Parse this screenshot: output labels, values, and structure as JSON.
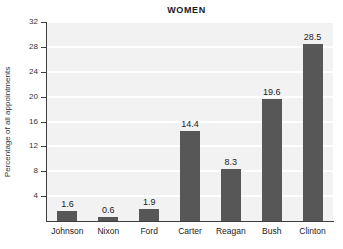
{
  "chart_data": {
    "type": "bar",
    "title": "WOMEN",
    "xlabel": "",
    "ylabel": "Percentage of all appointments",
    "categories": [
      "Johnson",
      "Nixon",
      "Ford",
      "Carter",
      "Reagan",
      "Bush",
      "Clinton"
    ],
    "values": [
      1.6,
      0.6,
      1.9,
      14.4,
      8.3,
      19.6,
      28.5
    ],
    "value_labels": [
      "1.6",
      "0.6",
      "1.9",
      "14.4",
      "8.3",
      "19.6",
      "28.5"
    ],
    "ylim": [
      0,
      32
    ],
    "yticks": [
      4,
      8,
      12,
      16,
      20,
      24,
      28,
      32
    ],
    "ytick_labels": [
      "4",
      "8",
      "12",
      "16",
      "20",
      "24",
      "28",
      "32"
    ],
    "grid": "horizontal",
    "legend": "none",
    "colors": {
      "bar": "#575757",
      "plot_background": "#f2f2f2",
      "gridline": "#ffffff",
      "axis": "#3d3d3d",
      "figure_background": "#ffffff",
      "text": "#1a1a1a"
    }
  }
}
